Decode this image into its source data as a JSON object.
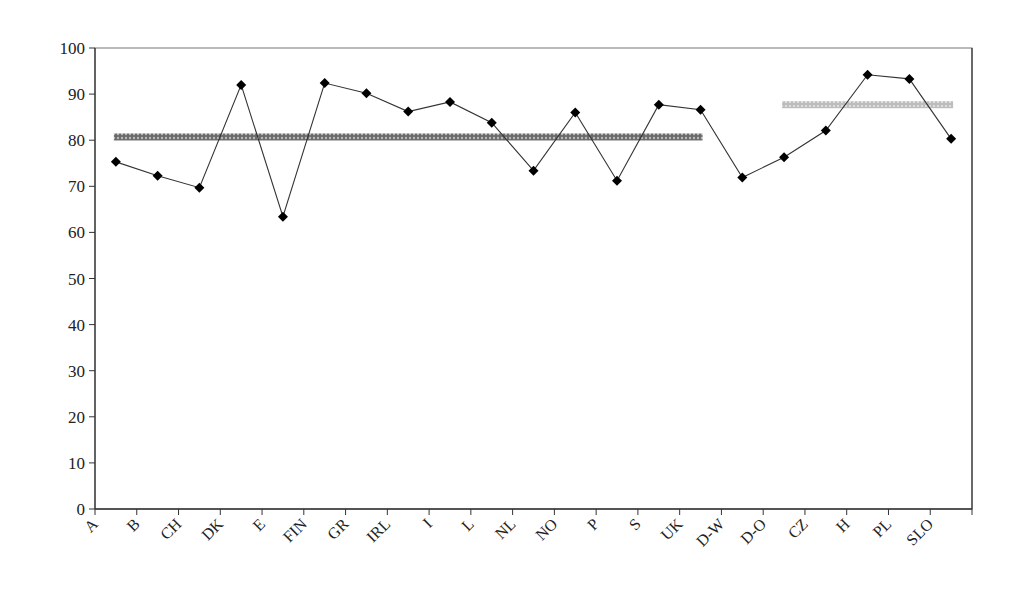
{
  "chart_data": {
    "type": "line",
    "title": "",
    "xlabel": "",
    "ylabel": "",
    "ylim": [
      0,
      100
    ],
    "yticks": [
      0,
      10,
      20,
      30,
      40,
      50,
      60,
      70,
      80,
      90,
      100
    ],
    "grid": false,
    "legend": null,
    "categories": [
      "A",
      "B",
      "CH",
      "DK",
      "E",
      "FIN",
      "GR",
      "IRL",
      "I",
      "L",
      "NL",
      "NO",
      "P",
      "S",
      "UK",
      "D-W",
      "D-O",
      "CZ",
      "H",
      "PL",
      "SLO"
    ],
    "series": [
      {
        "name": "Country values",
        "marker": "diamond",
        "color": "#000000",
        "values": [
          75.3,
          72.3,
          69.7,
          92.0,
          63.4,
          92.4,
          90.2,
          86.2,
          88.3,
          83.8,
          73.4,
          86.0,
          71.2,
          87.7,
          86.6,
          71.9,
          76.3,
          82.1,
          94.2,
          93.3,
          80.3
        ]
      }
    ],
    "reference_lines": [
      {
        "name": "Group average (A–UK)",
        "value": 80.7,
        "from_category": "A",
        "to_category": "UK",
        "color": "#555555",
        "style": "dark-hatched"
      },
      {
        "name": "Group average (D-O–SLO)",
        "value": 87.7,
        "from_category": "D-O",
        "to_category": "SLO",
        "color": "#aaaaaa",
        "style": "light-hatched"
      }
    ]
  }
}
